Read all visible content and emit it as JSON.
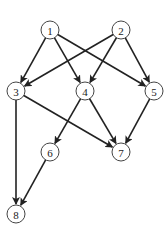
{
  "diagram": {
    "type": "directed-acyclic-graph",
    "node_radius": 9,
    "colors": {
      "node_stroke": "#444444",
      "edge": "#222222",
      "background": "#ffffff",
      "label": "#222222"
    },
    "nodes": [
      {
        "id": "1",
        "label": "1",
        "x": 50,
        "y": 30
      },
      {
        "id": "2",
        "label": "2",
        "x": 121,
        "y": 30
      },
      {
        "id": "3",
        "label": "3",
        "x": 16,
        "y": 91
      },
      {
        "id": "4",
        "label": "4",
        "x": 85,
        "y": 91
      },
      {
        "id": "5",
        "label": "5",
        "x": 154,
        "y": 91
      },
      {
        "id": "6",
        "label": "6",
        "x": 50,
        "y": 152
      },
      {
        "id": "7",
        "label": "7",
        "x": 121,
        "y": 152
      },
      {
        "id": "8",
        "label": "8",
        "x": 16,
        "y": 214
      }
    ],
    "edges": [
      {
        "from": "1",
        "to": "3"
      },
      {
        "from": "1",
        "to": "4"
      },
      {
        "from": "1",
        "to": "5"
      },
      {
        "from": "2",
        "to": "3"
      },
      {
        "from": "2",
        "to": "4"
      },
      {
        "from": "2",
        "to": "5"
      },
      {
        "from": "3",
        "to": "7"
      },
      {
        "from": "3",
        "to": "8"
      },
      {
        "from": "4",
        "to": "6"
      },
      {
        "from": "4",
        "to": "7"
      },
      {
        "from": "5",
        "to": "7"
      },
      {
        "from": "6",
        "to": "8"
      }
    ]
  }
}
